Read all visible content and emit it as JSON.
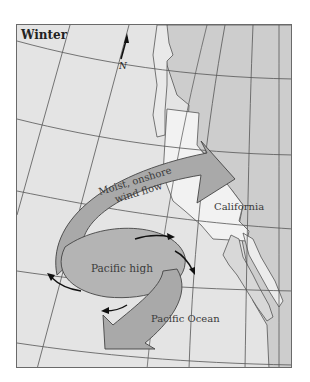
{
  "map": {
    "title": "Winter",
    "north_label": "N",
    "labels": {
      "california": "California",
      "pacific_high": "Pacific high",
      "pacific_ocean": "Pacific Ocean",
      "wind_line1": "Moist, onshore",
      "wind_line2": "wind flow"
    },
    "colors": {
      "ocean": "#e4e4e4",
      "land": "#cdcdcd",
      "california": "#f2f2f2",
      "arrow_fill": "#a9a9a9",
      "grid": "#555555",
      "frame": "#6a6a6a"
    }
  }
}
